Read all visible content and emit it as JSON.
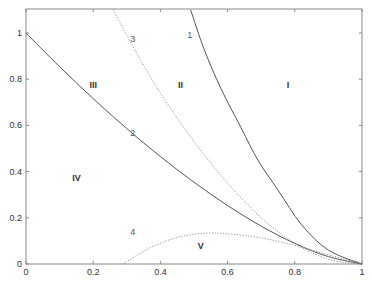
{
  "chart_data": {
    "type": "line",
    "title": "",
    "xlabel": "",
    "ylabel": "",
    "xlim": [
      0,
      1
    ],
    "ylim": [
      0,
      1.1
    ],
    "grid": false,
    "x_ticks": [
      "0",
      "0.2",
      "0.4",
      "0.6",
      "0.8",
      "1"
    ],
    "y_ticks": [
      "0",
      "0.2",
      "0.4",
      "0.6",
      "0.8",
      "1"
    ],
    "x_tick_values": [
      0,
      0.2,
      0.4,
      0.6,
      0.8,
      1
    ],
    "y_tick_values": [
      0,
      0.2,
      0.4,
      0.6,
      0.8,
      1
    ],
    "series": [
      {
        "name": "1",
        "style": "solid",
        "color": "#555555",
        "x": [
          0.49,
          0.53,
          0.58,
          0.64,
          0.69,
          0.75,
          0.82,
          0.9,
          1.0
        ],
        "y": [
          1.1,
          0.93,
          0.76,
          0.59,
          0.45,
          0.32,
          0.17,
          0.06,
          0.0
        ],
        "label_pos": [
          0.48,
          0.98
        ]
      },
      {
        "name": "2",
        "style": "solid",
        "color": "#555555",
        "x": [
          0.0,
          0.1,
          0.2,
          0.3,
          0.4,
          0.5,
          0.6,
          0.7,
          0.8,
          0.9,
          1.0
        ],
        "y": [
          1.0,
          0.854,
          0.716,
          0.586,
          0.465,
          0.354,
          0.253,
          0.164,
          0.089,
          0.032,
          0.0
        ],
        "label_pos": [
          0.31,
          0.555
        ]
      },
      {
        "name": "3",
        "style": "dotted",
        "color": "#888888",
        "x": [
          0.26,
          0.3,
          0.35,
          0.4,
          0.5,
          0.6,
          0.7,
          0.8,
          0.9,
          1.0
        ],
        "y": [
          1.1,
          0.99,
          0.86,
          0.74,
          0.53,
          0.35,
          0.2,
          0.09,
          0.02,
          0.0
        ],
        "label_pos": [
          0.31,
          0.96
        ]
      },
      {
        "name": "4",
        "style": "dotted",
        "color": "#888888",
        "x": [
          0.29,
          0.35,
          0.4,
          0.45,
          0.5,
          0.55,
          0.6,
          0.7,
          0.8,
          0.9,
          1.0
        ],
        "y": [
          0.0,
          0.055,
          0.09,
          0.115,
          0.129,
          0.134,
          0.131,
          0.113,
          0.08,
          0.04,
          0.0
        ],
        "label_pos": [
          0.31,
          0.125
        ]
      }
    ],
    "regions": [
      {
        "label": "I",
        "x": 0.78,
        "y": 0.76
      },
      {
        "label": "II",
        "x": 0.46,
        "y": 0.76
      },
      {
        "label": "III",
        "x": 0.2,
        "y": 0.76
      },
      {
        "label": "IV",
        "x": 0.15,
        "y": 0.36
      },
      {
        "label": "V",
        "x": 0.52,
        "y": 0.065
      }
    ]
  },
  "layout": {
    "x0_px": 26,
    "x1_px": 362,
    "y0_px": 264,
    "y1_px": 33,
    "top_px": 9
  },
  "caption": {
    "text": ""
  }
}
